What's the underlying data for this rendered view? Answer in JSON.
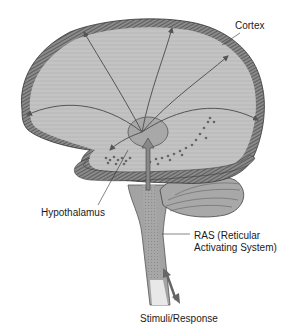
{
  "figure": {
    "labels": {
      "cortex": "Cortex",
      "hypothalamus": "Hypothalamus",
      "ras_line1": "RAS (Reticular",
      "ras_line2": "Activating System)",
      "stimuli": "Stimuli/Response"
    },
    "colors": {
      "cortex_fill": "#b5b5b5",
      "cortex_border": "#5a5a5a",
      "inner_fill": "#c4c4c4",
      "arrow": "#555555",
      "stem": "#9c9c9c",
      "cerebellum": "#a8a8a8",
      "text": "#1a1a1a"
    }
  }
}
